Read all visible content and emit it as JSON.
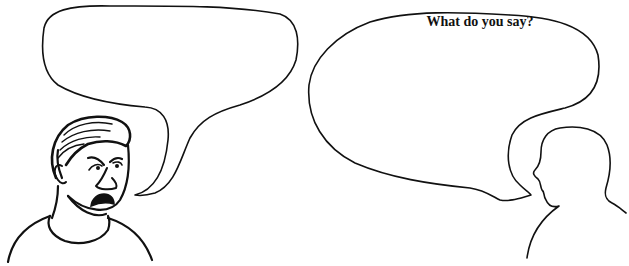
{
  "scene": {
    "description": "Two-panel speech-bubble worksheet illustration",
    "left_character": {
      "label": "angry man",
      "expression": "frowning, mouth open"
    },
    "right_character": {
      "label": "silhouette person"
    },
    "left_bubble": {
      "text": ""
    },
    "right_bubble": {
      "text": "What do you say?"
    }
  },
  "colors": {
    "ink": "#111111",
    "background": "#ffffff"
  }
}
